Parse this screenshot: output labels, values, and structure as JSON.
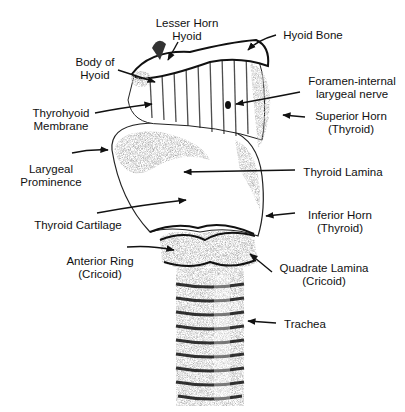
{
  "figure": {
    "labels": [
      {
        "id": "lesser-horn-hyoid",
        "lines": [
          "Lesser Horn",
          "Hyoid"
        ],
        "x": 152,
        "y": 17,
        "w": 70
      },
      {
        "id": "hyoid-bone",
        "lines": [
          "Hyoid Bone"
        ],
        "x": 278,
        "y": 29,
        "w": 70
      },
      {
        "id": "body-of-hyoid",
        "lines": [
          "Body of",
          "Hyoid"
        ],
        "x": 70,
        "y": 56,
        "w": 50
      },
      {
        "id": "foramen-internal-larygeal-nerve",
        "lines": [
          "Foramen-internal",
          "larygeal nerve"
        ],
        "x": 302,
        "y": 75,
        "w": 100
      },
      {
        "id": "thyrohyoid-membrane",
        "lines": [
          "Thyrohyoid",
          "Membrane"
        ],
        "x": 28,
        "y": 107,
        "w": 66
      },
      {
        "id": "superior-horn-thyroid",
        "lines": [
          "Superior Horn",
          "(Thyroid)"
        ],
        "x": 309,
        "y": 110,
        "w": 84
      },
      {
        "id": "larygeal-prominence",
        "lines": [
          "Larygeal",
          "Prominence"
        ],
        "x": 16,
        "y": 163,
        "w": 70
      },
      {
        "id": "thyroid-lamina",
        "lines": [
          "Thyroid Lamina"
        ],
        "x": 296,
        "y": 166,
        "w": 94
      },
      {
        "id": "thyroid-cartilage",
        "lines": [
          "Thyroid Cartilage"
        ],
        "x": 28,
        "y": 219,
        "w": 100
      },
      {
        "id": "inferior-horn-thyroid",
        "lines": [
          "Inferior Horn",
          "(Thyroid)"
        ],
        "x": 298,
        "y": 209,
        "w": 84
      },
      {
        "id": "anterior-ring-cricoid",
        "lines": [
          "Anterior Ring",
          "(Cricoid)"
        ],
        "x": 60,
        "y": 255,
        "w": 80
      },
      {
        "id": "quadrate-lamina-cricoid",
        "lines": [
          "Quadrate Lamina",
          "(Cricoid)"
        ],
        "x": 275,
        "y": 262,
        "w": 98
      },
      {
        "id": "trachea",
        "lines": [
          "Trachea"
        ],
        "x": 280,
        "y": 318,
        "w": 50
      }
    ]
  },
  "colors": {
    "background": "#ffffff",
    "ink": "#111111",
    "shade": "#555555"
  }
}
